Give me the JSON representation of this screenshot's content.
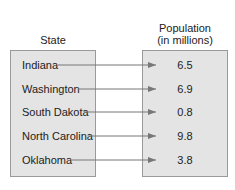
{
  "headers": {
    "left": "State",
    "right_line1": "Population",
    "right_line2": "(in millions)"
  },
  "mapping": [
    {
      "state": "Indiana",
      "population": "6.5"
    },
    {
      "state": "Washington",
      "population": "6.9"
    },
    {
      "state": "South Dakota",
      "population": "0.8"
    },
    {
      "state": "North Carolina",
      "population": "9.8"
    },
    {
      "state": "Oklahoma",
      "population": "3.8"
    }
  ],
  "colors": {
    "box_fill": "#e4e4e4",
    "box_border": "#9a9a9a",
    "arrow": "#777777"
  }
}
